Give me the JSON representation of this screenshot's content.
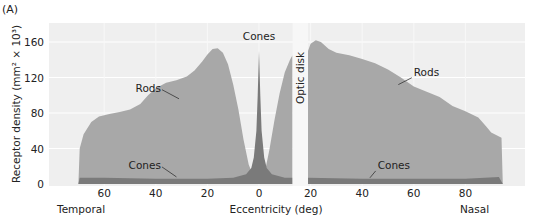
{
  "panel_label": "(A)",
  "chart_data": {
    "type": "area",
    "title": "",
    "xlabel": "Eccentricity (deg)",
    "ylabel": "Receptor density (mm² × 10³)",
    "ylim": [
      0,
      170
    ],
    "yticks": [
      0,
      40,
      80,
      120,
      160
    ],
    "xticks": [
      {
        "deg": -60,
        "label": "60"
      },
      {
        "deg": -40,
        "label": "40"
      },
      {
        "deg": -20,
        "label": "20"
      },
      {
        "deg": 0,
        "label": "0"
      },
      {
        "deg": 20,
        "label": "20"
      },
      {
        "deg": 40,
        "label": "40"
      },
      {
        "deg": 60,
        "label": "60"
      },
      {
        "deg": 80,
        "label": "80"
      }
    ],
    "x_side_labels": {
      "left": "Temporal",
      "right": "Nasal"
    },
    "grid": true,
    "optic_disk": {
      "label": "Optic disk",
      "from_deg": 13,
      "to_deg": 19
    },
    "series": [
      {
        "name": "Rods",
        "color": "#a8a8a8",
        "segments": [
          {
            "x": [
              -70,
              -69.5,
              -68,
              -65,
              -62,
              -58,
              -54,
              -50,
              -46,
              -43,
              -40,
              -36,
              -32,
              -28,
              -25,
              -22,
              -20,
              -18,
              -16,
              -14,
              -12,
              -10,
              -8,
              -6,
              -4,
              -2,
              -1,
              0,
              1,
              2,
              4,
              6,
              8,
              10,
              12,
              13
            ],
            "y": [
              0,
              40,
              56,
              70,
              76,
              79,
              81,
              84,
              90,
              100,
              108,
              114,
              117,
              121,
              128,
              138,
              146,
              152,
              153,
              148,
              135,
              112,
              84,
              50,
              22,
              7,
              3,
              1,
              3,
              10,
              38,
              72,
              102,
              126,
              140,
              145
            ]
          },
          {
            "x": [
              19,
              20,
              22,
              24,
              27,
              30,
              35,
              40,
              45,
              50,
              55,
              60,
              65,
              70,
              75,
              80,
              85,
              88,
              90,
              94,
              94.5
            ],
            "y": [
              150,
              158,
              162,
              160,
              152,
              148,
              145,
              141,
              136,
              129,
              120,
              110,
              104,
              98,
              88,
              82,
              75,
              65,
              58,
              52,
              0
            ]
          }
        ]
      },
      {
        "name": "Cones",
        "color": "#7a7a7a",
        "segments": [
          {
            "x": [
              -70,
              -69.5,
              -60,
              -40,
              -20,
              -10,
              -5,
              -3,
              -2,
              -1,
              -0.5,
              0,
              0.5,
              1,
              2,
              3,
              5,
              10,
              13
            ],
            "y": [
              0,
              7,
              7,
              6,
              6,
              7,
              11,
              18,
              30,
              60,
              100,
              150,
              100,
              60,
              30,
              18,
              11,
              7,
              7
            ]
          },
          {
            "x": [
              19,
              40,
              60,
              80,
              93,
              94.5
            ],
            "y": [
              7,
              6,
              6,
              6,
              8,
              0
            ]
          }
        ]
      }
    ],
    "annotations": [
      {
        "text": "Rods",
        "deg": -38,
        "value": 104,
        "anchor": "end",
        "leader_to": [
          -31,
          96
        ]
      },
      {
        "text": "Cones",
        "deg": 0,
        "value": 162,
        "anchor": "middle"
      },
      {
        "text": "Cones",
        "deg": -38,
        "value": 17,
        "anchor": "end",
        "leader_to": [
          -32,
          8
        ]
      },
      {
        "text": "Rods",
        "deg": 60,
        "value": 122,
        "anchor": "start",
        "leader_to": [
          54,
          112
        ]
      },
      {
        "text": "Cones",
        "deg": 46,
        "value": 17,
        "anchor": "start",
        "leader_to": [
          43,
          7
        ]
      }
    ]
  }
}
